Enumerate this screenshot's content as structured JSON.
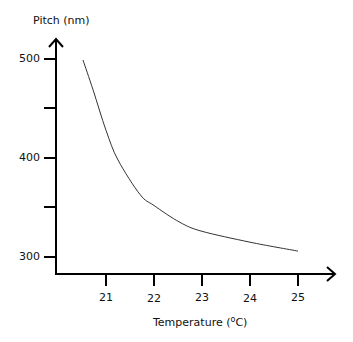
{
  "chart_data": {
    "type": "line",
    "title": "",
    "xlabel": "Temperature (ºC)",
    "ylabel": "Pitch (nm)",
    "x_ticks": [
      21,
      22,
      23,
      24,
      25
    ],
    "y_ticks": [
      300,
      400,
      500
    ],
    "y_minor_ticks": [
      350,
      450
    ],
    "xlim": [
      20,
      25.8
    ],
    "ylim": [
      283,
      521
    ],
    "grid": false,
    "legend": null,
    "series": [
      {
        "name": "Pitch",
        "x": [
          20.52,
          20.73,
          21.0,
          21.25,
          21.71,
          22.0,
          22.54,
          23.0,
          24.0,
          25.0
        ],
        "y": [
          499,
          469,
          428,
          398,
          363,
          352,
          335,
          326,
          315,
          306
        ],
        "color": "#333333"
      }
    ]
  },
  "labels": {
    "ylabel": "Pitch (nm)",
    "xlabel_prefix": "Temperature (",
    "xlabel_sup": "o",
    "xlabel_unit": "C)",
    "y_tick_labels": [
      "500",
      "400",
      "300"
    ],
    "x_tick_labels": [
      "21",
      "22",
      "23",
      "24",
      "25"
    ]
  }
}
